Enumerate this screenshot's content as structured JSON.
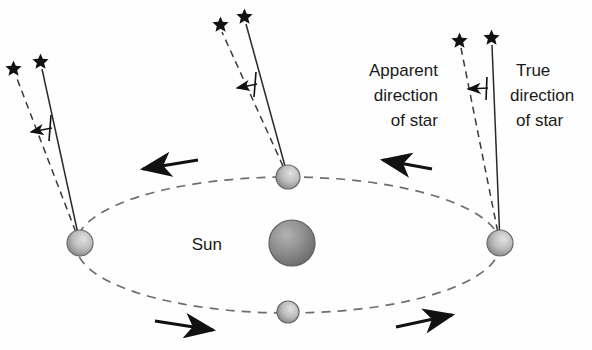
{
  "figure": {
    "title_visible": false,
    "background_color": "#fefefe",
    "width": 592,
    "height": 350
  },
  "labels": {
    "sun": "Sun",
    "apparent_line1": "Apparent",
    "apparent_line2": "direction",
    "apparent_line3": "of star",
    "true_line1": "True",
    "true_line2": "direction",
    "true_line3": "of star"
  },
  "colors": {
    "ink": "#1a1a1a",
    "orbit": "#6e6e6e",
    "sun_fill": "#8d8d8d",
    "planet_fill": "#b9b9b9",
    "star": "#111111",
    "arrow": "#111111"
  },
  "orbit": {
    "center_x": 288,
    "center_y": 245,
    "radius_x": 212,
    "radius_y": 68,
    "style": "dashed"
  },
  "sun": {
    "cx": 292,
    "cy": 243,
    "r": 23,
    "label_x": 222,
    "label_y": 249
  },
  "planets": [
    {
      "name": "planet-left",
      "cx": 80,
      "cy": 243,
      "r": 13
    },
    {
      "name": "planet-top",
      "cx": 288,
      "cy": 177,
      "r": 12
    },
    {
      "name": "planet-right",
      "cx": 500,
      "cy": 243,
      "r": 13
    },
    {
      "name": "planet-bottom",
      "cx": 288,
      "cy": 312,
      "r": 11
    }
  ],
  "sight_groups": [
    {
      "name": "left",
      "apparent": {
        "x1": 80,
        "y1": 243,
        "x2": 16,
        "y2": 76
      },
      "true": {
        "x1": 80,
        "y1": 243,
        "x2": 42,
        "y2": 69
      },
      "star_apparent": {
        "x": 13,
        "y": 68
      },
      "star_true": {
        "x": 40,
        "y": 61
      },
      "aberration_arrow": {
        "x1": 50,
        "y1": 128,
        "x2": 30,
        "y2": 132
      },
      "tick": {
        "x1": 51,
        "y1": 115,
        "x2": 49,
        "y2": 141
      }
    },
    {
      "name": "top",
      "apparent": {
        "x1": 288,
        "y1": 177,
        "x2": 222,
        "y2": 32
      },
      "true": {
        "x1": 288,
        "y1": 177,
        "x2": 246,
        "y2": 24
      },
      "star_apparent": {
        "x": 220,
        "y": 24
      },
      "star_true": {
        "x": 244,
        "y": 16
      },
      "aberration_arrow": {
        "x1": 255,
        "y1": 84,
        "x2": 236,
        "y2": 88
      },
      "tick": {
        "x1": 256,
        "y1": 72,
        "x2": 254,
        "y2": 97
      }
    },
    {
      "name": "right",
      "apparent": {
        "x1": 500,
        "y1": 243,
        "x2": 461,
        "y2": 48
      },
      "true": {
        "x1": 500,
        "y1": 243,
        "x2": 492,
        "y2": 45
      },
      "star_apparent": {
        "x": 459,
        "y": 40
      },
      "star_true": {
        "x": 491,
        "y": 37
      },
      "aberration_arrow": {
        "x1": 486,
        "y1": 88,
        "x2": 467,
        "y2": 89
      },
      "tick": {
        "x1": 487,
        "y1": 77,
        "x2": 486,
        "y2": 100
      }
    }
  ],
  "motion_arrows": [
    {
      "name": "motion-arrow-top-left",
      "x1": 198,
      "y1": 160,
      "x2": 140,
      "y2": 170,
      "direction": "left"
    },
    {
      "name": "motion-arrow-top-right",
      "x1": 432,
      "y1": 169,
      "x2": 380,
      "y2": 159,
      "direction": "left"
    },
    {
      "name": "motion-arrow-bottom-left",
      "x1": 155,
      "y1": 321,
      "x2": 216,
      "y2": 331,
      "direction": "right"
    },
    {
      "name": "motion-arrow-bottom-right",
      "x1": 396,
      "y1": 327,
      "x2": 455,
      "y2": 314,
      "direction": "right"
    }
  ],
  "text_blocks": {
    "apparent": {
      "x": 438,
      "y": 76,
      "anchor": "end",
      "line_height": 25
    },
    "true": {
      "x": 515,
      "y": 76,
      "anchor": "start",
      "line_height": 25
    }
  }
}
